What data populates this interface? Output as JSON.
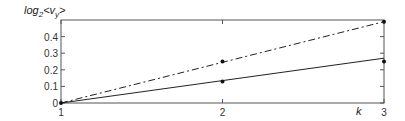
{
  "chart_data": {
    "type": "line",
    "title": "",
    "xlabel": "k",
    "ylabel": "log2<vy>",
    "ylabel_parts": {
      "base": "log",
      "sub": "2",
      "lt": "<",
      "v": "v",
      "vsub": "y",
      "gt": ">"
    },
    "xlim": [
      1,
      3
    ],
    "ylim": [
      0,
      0.5
    ],
    "x_ticks": [
      1,
      2,
      3
    ],
    "y_ticks": [
      0,
      0.1,
      0.2,
      0.3,
      0.4
    ],
    "y_tick_labels": [
      "0",
      "0.1",
      "0.2",
      "0.3",
      "0.4"
    ],
    "grid": false,
    "legend": null,
    "series": [
      {
        "name": "dash-dot line",
        "style": "dashdot",
        "x": [
          1,
          3
        ],
        "values": [
          0,
          0.49
        ]
      },
      {
        "name": "solid line",
        "style": "solid",
        "x": [
          1,
          3
        ],
        "values": [
          0,
          0.27
        ]
      },
      {
        "name": "points",
        "style": "markers",
        "x": [
          1,
          2,
          2,
          3,
          3
        ],
        "values": [
          0,
          0.25,
          0.13,
          0.49,
          0.25
        ]
      }
    ]
  }
}
